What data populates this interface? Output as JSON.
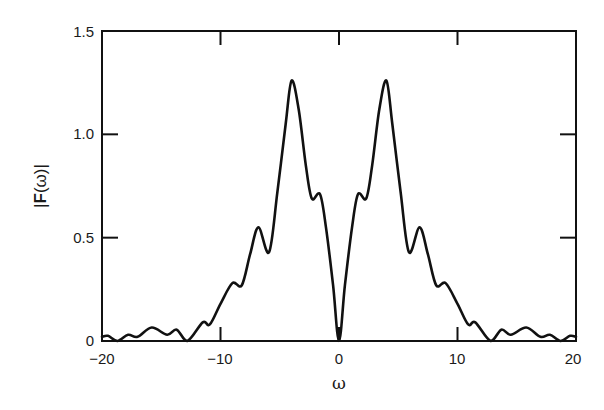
{
  "chart_data": {
    "type": "line",
    "title": "",
    "xlabel": "ω",
    "ylabel": "|F(ω)|",
    "xlim": [
      -20,
      20
    ],
    "ylim": [
      0,
      1.5
    ],
    "grid": false,
    "legend": null,
    "x_ticks": [
      -20,
      -10,
      0,
      10,
      20
    ],
    "x_tick_labels": [
      "−20",
      "−10",
      "0",
      "10",
      "20"
    ],
    "y_ticks": [
      0,
      0.5,
      1.0,
      1.5
    ],
    "y_tick_labels": [
      "0",
      "0.5",
      "1.0",
      "1.5"
    ],
    "series": [
      {
        "name": "|F(ω)|",
        "color": "#111111",
        "x": [
          -20,
          -19.5,
          -18.7,
          -17.8,
          -17,
          -15.8,
          -14.5,
          -13.7,
          -12.8,
          -11.5,
          -10.9,
          -10,
          -9,
          -8.2,
          -7.5,
          -6.8,
          -5.9,
          -5.2,
          -4.5,
          -4,
          -3.4,
          -2.8,
          -2.3,
          -1.6,
          -1.1,
          -0.5,
          0,
          0.5,
          1.1,
          1.6,
          2.3,
          2.8,
          3.4,
          4,
          4.5,
          5.2,
          5.9,
          6.8,
          7.5,
          8.2,
          9,
          10,
          10.9,
          11.5,
          12.8,
          13.7,
          14.5,
          15.8,
          17,
          17.8,
          18.7,
          19.5,
          20
        ],
        "y": [
          0.02,
          0.025,
          0.0,
          0.03,
          0.02,
          0.065,
          0.03,
          0.055,
          0.0,
          0.09,
          0.08,
          0.18,
          0.28,
          0.27,
          0.42,
          0.55,
          0.43,
          0.72,
          1.05,
          1.26,
          1.12,
          0.85,
          0.69,
          0.71,
          0.55,
          0.27,
          0.0,
          0.27,
          0.55,
          0.71,
          0.69,
          0.85,
          1.12,
          1.26,
          1.05,
          0.72,
          0.43,
          0.55,
          0.42,
          0.27,
          0.28,
          0.18,
          0.08,
          0.09,
          0.0,
          0.055,
          0.03,
          0.065,
          0.02,
          0.03,
          0.0,
          0.025,
          0.02
        ]
      }
    ],
    "annotations": []
  },
  "axes": {
    "x_label": "ω",
    "y_label_pre": "|",
    "y_label_bold": "F",
    "y_label_post": "(ω)|",
    "x_tick_labels": [
      "−20",
      "−10",
      "0",
      "10",
      "20"
    ],
    "y_tick_labels": [
      "0",
      "0.5",
      "1.0",
      "1.5"
    ]
  }
}
